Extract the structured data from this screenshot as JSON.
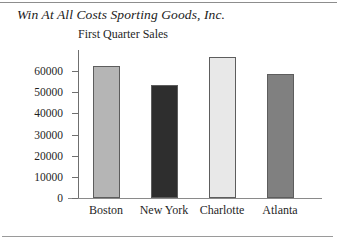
{
  "chart_data": {
    "type": "bar",
    "title": "Win At All Costs Sporting Goods, Inc.",
    "subtitle": "First Quarter Sales",
    "xlabel": "",
    "ylabel": "",
    "categories": [
      "Boston",
      "New York",
      "Charlotte",
      "Atlanta"
    ],
    "values": [
      62400,
      53300,
      66700,
      58600
    ],
    "bar_colors": [
      "#b5b5b5",
      "#2e2e2e",
      "#e8e8e8",
      "#808080"
    ],
    "ylim": [
      0,
      70000
    ],
    "yticks": [
      0,
      10000,
      20000,
      30000,
      40000,
      50000,
      60000
    ],
    "ytick_labels": [
      "0",
      "10000",
      "20000",
      "30000",
      "40000",
      "50000",
      "60000"
    ],
    "grid": false,
    "legend": "none"
  }
}
